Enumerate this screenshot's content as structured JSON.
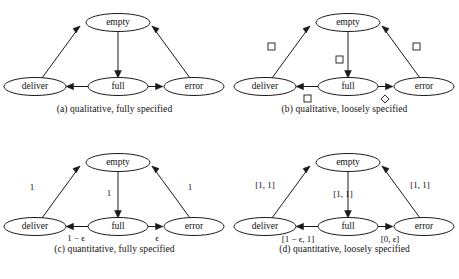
{
  "figure": {
    "nodes": {
      "empty": "empty",
      "deliver": "deliver",
      "full": "full",
      "error": "error"
    },
    "panels": [
      {
        "id": "a",
        "caption": "(a) qualitative, fully specified",
        "labels": {
          "deliver_to_empty": "",
          "empty_to_full": "",
          "error_to_empty": "",
          "full_to_deliver": "",
          "full_to_error": ""
        },
        "markers": {
          "deliver_to_empty": "none",
          "empty_to_full": "none",
          "error_to_empty": "none",
          "full_to_deliver": "none",
          "full_to_error": "none"
        }
      },
      {
        "id": "b",
        "caption": "(b) qualitative, loosely specified",
        "labels": {
          "deliver_to_empty": "",
          "empty_to_full": "",
          "error_to_empty": "",
          "full_to_deliver": "",
          "full_to_error": ""
        },
        "markers": {
          "deliver_to_empty": "square",
          "empty_to_full": "square",
          "error_to_empty": "square",
          "full_to_deliver": "square",
          "full_to_error": "diamond"
        }
      },
      {
        "id": "c",
        "caption": "(c) quantitative, fully specified",
        "labels": {
          "deliver_to_empty": "1",
          "empty_to_full": "1",
          "error_to_empty": "1",
          "full_to_deliver": "1 − ϵ",
          "full_to_error": "ϵ"
        },
        "markers": {
          "deliver_to_empty": "none",
          "empty_to_full": "none",
          "error_to_empty": "none",
          "full_to_deliver": "none",
          "full_to_error": "none"
        }
      },
      {
        "id": "d",
        "caption": "(d) quantitative, loosely specified",
        "labels": {
          "deliver_to_empty": "[1, 1]",
          "empty_to_full": "[1, 1]",
          "error_to_empty": "[1, 1]",
          "full_to_deliver": "[1 − ϵ, 1]",
          "full_to_error": "[0, ϵ]"
        },
        "markers": {
          "deliver_to_empty": "none",
          "empty_to_full": "none",
          "error_to_empty": "none",
          "full_to_deliver": "none",
          "full_to_error": "none"
        }
      }
    ],
    "colors": {
      "ink": "#1a1a1a",
      "paper": "#ffffff"
    }
  }
}
